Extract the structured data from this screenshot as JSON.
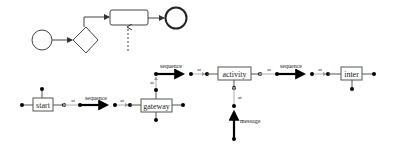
{
  "top_diagram": {
    "nodes": [
      {
        "id": "start-event",
        "shape": "circle"
      },
      {
        "id": "gateway",
        "shape": "diamond"
      },
      {
        "id": "task",
        "shape": "rounded-rect"
      },
      {
        "id": "end-event",
        "shape": "circle-bold"
      }
    ],
    "edges": [
      {
        "from": "start-event",
        "to": "gateway",
        "style": "solid-arrow"
      },
      {
        "from": "gateway",
        "to": "task",
        "style": "solid-arrow"
      },
      {
        "from": "task",
        "to": "end-event",
        "style": "solid-arrow"
      },
      {
        "from": "external",
        "to": "task",
        "style": "dashed-arrow"
      }
    ]
  },
  "bottom_diagram": {
    "nodes": {
      "start": "start",
      "gateway": "gateway",
      "activity": "activity",
      "inter": "inter"
    },
    "edges": {
      "seq1": "sequence",
      "seq2": "sequence",
      "seq3": "sequence",
      "msg": "message"
    },
    "attach_label": "at",
    "colors": {
      "line": "#000000",
      "attach": "#888888",
      "box_border": "#555555"
    }
  }
}
